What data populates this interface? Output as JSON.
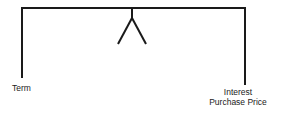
{
  "diagram": {
    "type": "balance-scale",
    "left_label": "Term",
    "right_labels": [
      "Interest",
      "Purchase Price"
    ],
    "colors": {
      "line": "#1a1a1a",
      "text": "#222222",
      "background": "#ffffff"
    }
  }
}
